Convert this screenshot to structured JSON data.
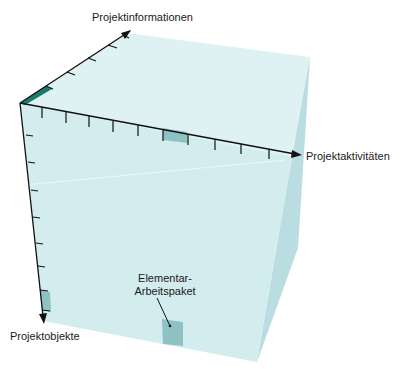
{
  "diagram": {
    "type": "3d-cube",
    "axes": {
      "information": {
        "label": "Projektinformationen",
        "ticks": 5
      },
      "activities": {
        "label": "Projektaktivitäten",
        "ticks": 10
      },
      "objects": {
        "label": "Projektobjekte",
        "ticks": 8
      }
    },
    "callout": {
      "line1": "Elementar-",
      "line2": "Arbeitspaket"
    },
    "colors": {
      "front_face": "#d3ecee",
      "top_face": "#dff2f3",
      "right_face": "#b9dde0",
      "highlight_dark": "#1a7a6e",
      "highlight_cell": "#8ec2c3",
      "axis": "#111111"
    }
  }
}
